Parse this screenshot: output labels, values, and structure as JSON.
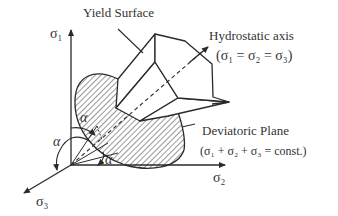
{
  "diagram": {
    "labels": {
      "yield_surface": "Yield Surface",
      "hydrostatic_axis": "Hydrostatic axis",
      "hydrostatic_eq": "(σ₁ = σ₂ = σ₃)",
      "deviatoric_plane": "Deviatoric Plane",
      "deviatoric_eq": "(σ₁ + σ₂ + σ₃ = const.)",
      "axis_sigma1": "σ₁",
      "axis_sigma2": "σ₂",
      "axis_sigma3": "σ₃",
      "angle_alpha": "α"
    },
    "colors": {
      "line": "#2a2a2a",
      "hatch": "#333333",
      "text": "#333333",
      "background": "#ffffff"
    }
  }
}
